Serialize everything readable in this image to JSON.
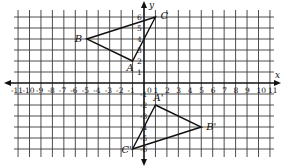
{
  "diagram": {
    "type": "coordinate-plane-reflection",
    "axes": {
      "x_label": "x",
      "y_label": "y",
      "x_range": [
        -11,
        11
      ],
      "y_range": [
        -6,
        6
      ],
      "x_ticks": [
        -11,
        -10,
        -9,
        -8,
        -7,
        -6,
        -5,
        -4,
        -3,
        -2,
        -1,
        0,
        1,
        2,
        3,
        4,
        5,
        6,
        7,
        8,
        9,
        10,
        11
      ],
      "y_ticks": [
        -6,
        -5,
        -4,
        -3,
        -2,
        -1,
        1,
        2,
        3,
        4,
        5,
        6
      ]
    },
    "triangles": [
      {
        "name": "ABC",
        "vertices": [
          {
            "label": "A",
            "x": -1,
            "y": 2
          },
          {
            "label": "B",
            "x": -5,
            "y": 4
          },
          {
            "label": "C",
            "x": 1,
            "y": 6
          }
        ]
      },
      {
        "name": "A'B'C'",
        "vertices": [
          {
            "label": "A'",
            "x": 1,
            "y": -2
          },
          {
            "label": "B'",
            "x": 5,
            "y": -4
          },
          {
            "label": "C'",
            "x": -1,
            "y": -6
          }
        ]
      }
    ],
    "colors": {
      "line": "#111111",
      "grid": "#3a3a3a",
      "background": "#ffffff"
    }
  }
}
